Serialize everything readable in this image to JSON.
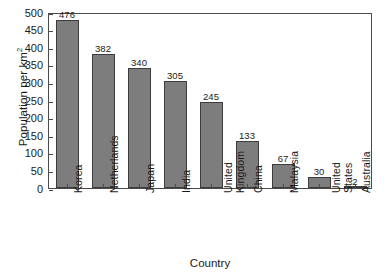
{
  "chart_data": {
    "type": "bar",
    "title": "",
    "xlabel": "Country",
    "ylabel": "Population per km2",
    "ylabel_base": "Population per km",
    "ylabel_sup": "2",
    "categories": [
      "Korea",
      "Netherlands",
      "Japan",
      "India",
      "United Kingdom",
      "China",
      "Malaysia",
      "United States",
      "Australia"
    ],
    "category_lines": [
      [
        "Korea"
      ],
      [
        "Netherlands"
      ],
      [
        "Japan"
      ],
      [
        "India"
      ],
      [
        "United",
        "Kingdom"
      ],
      [
        "China"
      ],
      [
        "Malaysia"
      ],
      [
        "United",
        "States"
      ],
      [
        "Australia"
      ]
    ],
    "values": [
      476,
      382,
      340,
      305,
      245,
      133,
      67,
      30,
      2
    ],
    "value_labels": [
      "476",
      "382",
      "340",
      "305",
      "245",
      "133",
      "67",
      "30",
      "2"
    ],
    "ylim": [
      0,
      500
    ],
    "yticks": [
      0,
      50,
      100,
      150,
      200,
      250,
      300,
      350,
      400,
      450,
      500
    ],
    "ytick_labels": [
      "0",
      "50",
      "100",
      "150",
      "200",
      "250",
      "300",
      "350",
      "400",
      "450",
      "500"
    ],
    "grid": false,
    "legend": null,
    "bar_color": "#7d7d7d",
    "bar_edge_color": "#3c3c3c",
    "axis_color": "#4a4a4a",
    "background_color": "#ffffff"
  }
}
